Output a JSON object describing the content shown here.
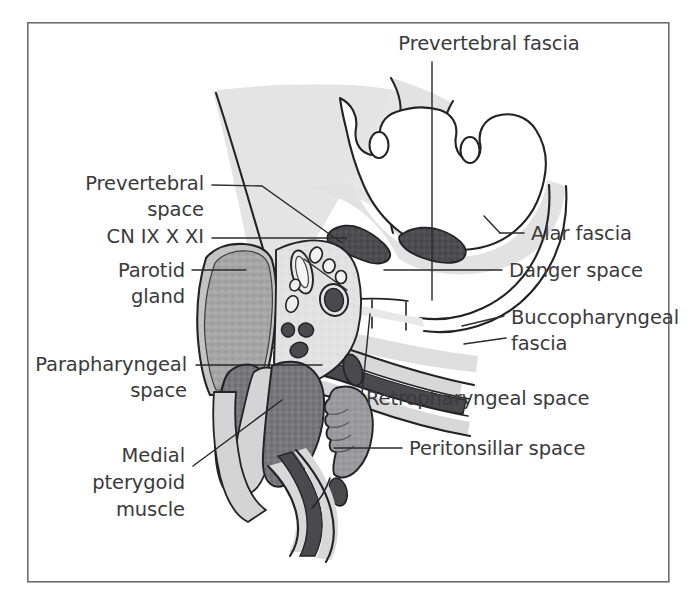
{
  "figure": {
    "frame": {
      "x": 27,
      "y": 22,
      "width": 642,
      "height": 560,
      "stroke_color": "#6d6d70"
    },
    "background_color": "#ffffff",
    "label_color": "#3a3a3c",
    "outline_color": "#232325"
  },
  "labels": [
    {
      "id": "prevertebral-fascia",
      "text": "Prevertebral fascia",
      "lines": [
        "Prevertebral fascia"
      ],
      "anchor": "middle",
      "x": 489,
      "y": 50,
      "align": "center"
    },
    {
      "id": "prevertebral-space",
      "text": "Prevertebral space",
      "lines": [
        "Prevertebral",
        "space"
      ],
      "anchor": "end",
      "x": 204,
      "y": 190,
      "align": "right"
    },
    {
      "id": "cn-ix-x-xi",
      "text": "CN IX X XI",
      "lines": [
        "CN IX X XI"
      ],
      "anchor": "end",
      "x": 204,
      "y": 243,
      "align": "right"
    },
    {
      "id": "parotid-gland",
      "text": "Parotid gland",
      "lines": [
        "Parotid",
        "gland"
      ],
      "anchor": "end",
      "x": 185,
      "y": 275,
      "align": "right"
    },
    {
      "id": "parapharyngeal-space",
      "text": "Parapharyngeal space",
      "lines": [
        "Parapharyngeal",
        "space"
      ],
      "anchor": "end",
      "x": 187,
      "y": 369,
      "align": "right"
    },
    {
      "id": "medial-pterygoid-muscle",
      "text": "Medial pterygoid muscle",
      "lines": [
        "Medial",
        "pterygoid",
        "muscle"
      ],
      "anchor": "end",
      "x": 185,
      "y": 460,
      "align": "right"
    },
    {
      "id": "alar-fascia",
      "text": "Alar fascia",
      "lines": [
        "Alar fascia"
      ],
      "anchor": "start",
      "x": 531,
      "y": 238,
      "align": "left"
    },
    {
      "id": "danger-space",
      "text": "Danger space",
      "lines": [
        "Danger space"
      ],
      "anchor": "start",
      "x": 508,
      "y": 275,
      "align": "left"
    },
    {
      "id": "buccopharyngeal-fascia",
      "text": "Buccopharyngeal fascia",
      "lines": [
        "Buccopharyngeal",
        "fascia"
      ],
      "anchor": "start",
      "x": 511,
      "y": 322,
      "align": "left"
    },
    {
      "id": "retropharyngeal-space",
      "text": "Retropharyngeal space",
      "lines": [
        "Retropharyngeal space"
      ],
      "anchor": "start",
      "x": 366,
      "y": 403,
      "align": "left"
    },
    {
      "id": "peritonsillar-space",
      "text": "Peritonsillar space",
      "lines": [
        "Peritonsillar space"
      ],
      "anchor": "start",
      "x": 409,
      "y": 453,
      "align": "left"
    }
  ],
  "structures": [
    {
      "id": "vertebral-body",
      "name": "Vertebral body",
      "fill": "#ffffff"
    },
    {
      "id": "prevertebral-fascia-band",
      "name": "Prevertebral fascia band",
      "fill": "#e2e2e2"
    },
    {
      "id": "prevertebral-muscles",
      "name": "Prevertebral muscles",
      "fill": "#4d4d4f"
    },
    {
      "id": "parotid-gland-shape",
      "name": "Parotid gland",
      "fill": "#a6a6a6"
    },
    {
      "id": "medial-pterygoid-shape",
      "name": "Medial pterygoid muscle",
      "fill": "#76767a"
    },
    {
      "id": "parapharyngeal-fat",
      "name": "Parapharyngeal space fat",
      "fill": "#d6d6d6"
    },
    {
      "id": "carotid-artery",
      "name": "Carotid artery",
      "fill": "#e8e8e8"
    },
    {
      "id": "jugular-vein",
      "name": "Internal jugular vein",
      "fill": "#4d4d4f"
    },
    {
      "id": "cranial-nerves",
      "name": "Cranial nerves IX X XI",
      "fill": "#5a5a5d"
    },
    {
      "id": "pharyngeal-constrictor",
      "name": "Pharyngeal constrictor muscle",
      "fill": "#4d4d4f"
    },
    {
      "id": "palatine-tonsil",
      "name": "Palatine tonsil",
      "fill": "#9a9a9e"
    },
    {
      "id": "retropharyngeal-space-shape",
      "name": "Retropharyngeal space",
      "fill": "#e2e2e2"
    },
    {
      "id": "danger-space-shape",
      "name": "Danger space",
      "fill": "#ffffff"
    }
  ],
  "colors": {
    "fat_light": "#e2e2e2",
    "fat_mid": "#d6d6d6",
    "gland_gray": "#a6a6a6",
    "muscle_dark": "#4d4d4f",
    "muscle_mid": "#76767a",
    "tonsil_gray": "#9a9a9e",
    "outline": "#232325",
    "label": "#3a3a3c",
    "frame": "#6d6d70"
  }
}
